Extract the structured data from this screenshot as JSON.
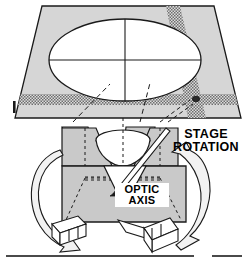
{
  "diagram": {
    "labels": {
      "stage_rotation": "STAGE\nROTATION",
      "stage_rotation_line1": "STAGE",
      "stage_rotation_line2": "ROTATION",
      "optic_axis": "OPTIC\nAXIS",
      "optic_axis_line1": "OPTIC",
      "optic_axis_line2": "AXIS",
      "plate_tick_marker": "I"
    },
    "colors": {
      "ink": "#1a1a1a",
      "plate_fill": "#d6d6d6",
      "cone_fill": "#c9c9c9",
      "block_fill": "#cdcdcd",
      "band_fill": "#9a9a9a",
      "white": "#ffffff",
      "arrow_fill": "#f2f2f2"
    },
    "parts": [
      {
        "name": "projection-screen",
        "shape": "trapezoid",
        "note": "square screen in perspective"
      },
      {
        "name": "interference-ellipse",
        "shape": "ellipse",
        "note": "circular field seen in perspective"
      },
      {
        "name": "crosshair-vertical",
        "shape": "line"
      },
      {
        "name": "crosshair-horizontal",
        "shape": "line"
      },
      {
        "name": "isogyre-band-diagonal",
        "shape": "stippled-band"
      },
      {
        "name": "isogyre-band-horizontal",
        "shape": "stippled-band"
      },
      {
        "name": "melatope-dot",
        "shape": "dot"
      },
      {
        "name": "light-cone",
        "shape": "cone"
      },
      {
        "name": "specimen-block",
        "shape": "box"
      },
      {
        "name": "rotation-arrow-left",
        "shape": "curved-arrow"
      },
      {
        "name": "rotation-arrow-right",
        "shape": "curved-arrow"
      },
      {
        "name": "stage-block-left",
        "shape": "3d-block"
      },
      {
        "name": "stage-block-right",
        "shape": "3d-block"
      },
      {
        "name": "bottom-rule",
        "shape": "line"
      }
    ]
  }
}
